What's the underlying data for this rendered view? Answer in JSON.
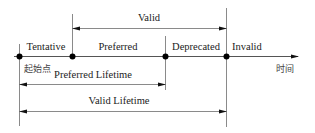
{
  "diagram": {
    "timeline": {
      "start_label": "起始点",
      "axis_label": "时间",
      "states": [
        {
          "label": "Tentative"
        },
        {
          "label": "Preferred"
        },
        {
          "label": "Deprecated"
        },
        {
          "label": "Invalid"
        }
      ]
    },
    "spans": {
      "valid": {
        "label": "Valid"
      },
      "preferred_lifetime": {
        "label": "Preferred Lifetime"
      },
      "valid_lifetime": {
        "label": "Valid Lifetime"
      }
    },
    "colors": {
      "line": "#8a8a8a",
      "axis": "#333333",
      "dot": "#000000",
      "text": "#222222"
    }
  }
}
